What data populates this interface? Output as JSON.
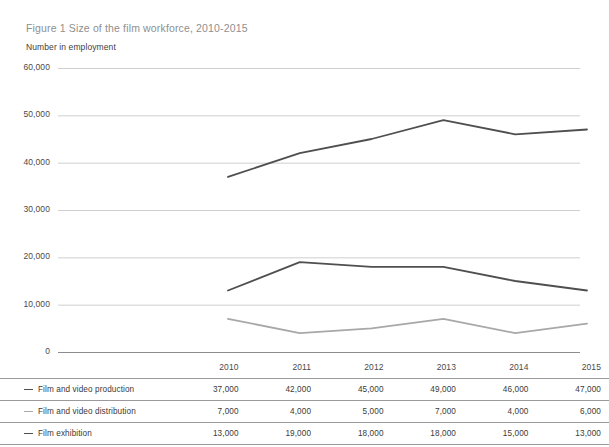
{
  "figure": {
    "title": "Figure 1 Size of the film workforce, 2010-2015",
    "axis_title": "Number in employment"
  },
  "chart_data": {
    "type": "line",
    "title": "Figure 1 Size of the film workforce, 2010-2015",
    "xlabel": "",
    "ylabel": "Number in employment",
    "categories": [
      "2010",
      "2011",
      "2012",
      "2013",
      "2014",
      "2015"
    ],
    "ylim": [
      0,
      60000
    ],
    "ytick_labels": [
      "60,000",
      "50,000",
      "40,000",
      "30,000",
      "20,000",
      "10,000",
      "0"
    ],
    "ytick_values": [
      60000,
      50000,
      40000,
      30000,
      20000,
      10000,
      0
    ],
    "grid": true,
    "legend": "table-rows",
    "series": [
      {
        "name": "Film and video production",
        "color": "#4f4f4f",
        "values": [
          37000,
          42000,
          45000,
          49000,
          46000,
          47000
        ],
        "labels": [
          "37,000",
          "42,000",
          "45,000",
          "49,000",
          "46,000",
          "47,000"
        ]
      },
      {
        "name": "Film and video distribution",
        "color": "#a8a8a8",
        "values": [
          7000,
          4000,
          5000,
          7000,
          4000,
          6000
        ],
        "labels": [
          "7,000",
          "4,000",
          "5,000",
          "7,000",
          "4,000",
          "6,000"
        ]
      },
      {
        "name": "Film exhibition",
        "color": "#4f4f4f",
        "values": [
          13000,
          19000,
          18000,
          18000,
          15000,
          13000
        ],
        "labels": [
          "13,000",
          "19,000",
          "18,000",
          "18,000",
          "15,000",
          "13,000"
        ]
      }
    ]
  },
  "table": {
    "corner_label": "",
    "column_headers": [
      "2010",
      "2011",
      "2012",
      "2013",
      "2014",
      "2015"
    ],
    "rows": [
      {
        "label": "Film and video production",
        "swatch": "#4f4f4f",
        "values": [
          "37,000",
          "42,000",
          "45,000",
          "49,000",
          "46,000",
          "47,000"
        ]
      },
      {
        "label": "Film and video distribution",
        "swatch": "#a8a8a8",
        "values": [
          "7,000",
          "4,000",
          "5,000",
          "7,000",
          "4,000",
          "6,000"
        ]
      },
      {
        "label": "Film exhibition",
        "swatch": "#4f4f4f",
        "values": [
          "13,000",
          "19,000",
          "18,000",
          "18,000",
          "15,000",
          "13,000"
        ]
      }
    ]
  }
}
